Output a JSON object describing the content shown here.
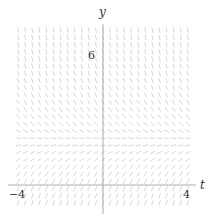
{
  "chart_data": {
    "type": "slope_field",
    "title": "",
    "xlabel": "t",
    "ylabel": "y",
    "equation": "dy/dt = 2 - y",
    "equilibrium_y": 2,
    "xlim": [
      -4.4,
      4.6
    ],
    "ylim": [
      -1.3,
      8.2
    ],
    "grid": false,
    "x_ticks": [
      {
        "value": -4,
        "label": "−4"
      },
      {
        "value": 4,
        "label": "4"
      }
    ],
    "y_ticks": [
      {
        "value": 6,
        "label": "6"
      }
    ],
    "sample_t": {
      "start": -4,
      "end": 4,
      "step": 0.3333
    },
    "sample_y": {
      "start": -0.8333,
      "end": 7.1667,
      "step": 0.3333
    },
    "segment_length": 5.5,
    "colors": {
      "segment": "#c4c4c4",
      "axis": "#9a9a9a",
      "label": "#333333"
    }
  },
  "labels": {
    "x_axis": "t",
    "y_axis": "y",
    "tick_neg4": "−4",
    "tick_4": "4",
    "tick_6": "6"
  }
}
